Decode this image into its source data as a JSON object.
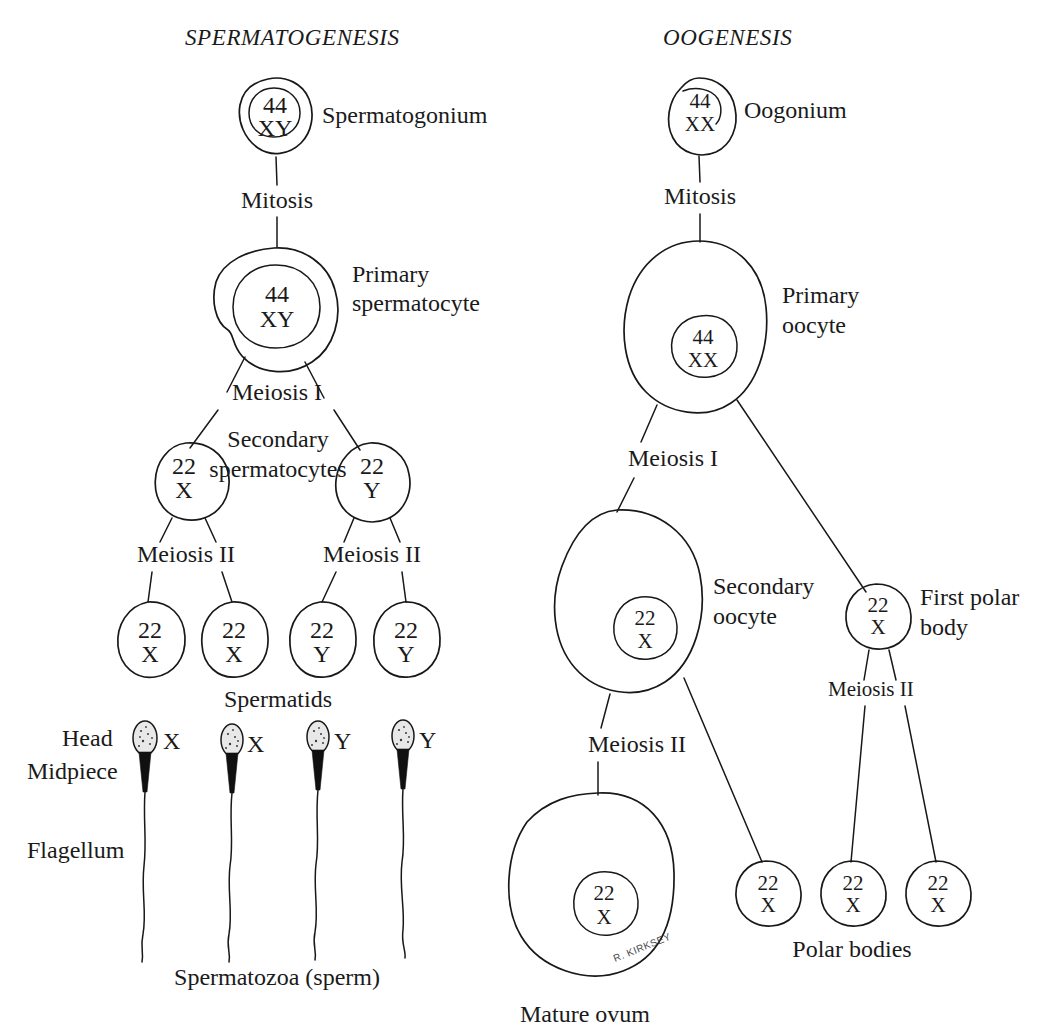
{
  "figure": {
    "type": "diagram",
    "background_color": "#ffffff",
    "ink_color": "#181818",
    "signature": "R. KIRKSEY"
  },
  "columns": {
    "left": {
      "title": "SPERMATOGENESIS"
    },
    "right": {
      "title": "OOGENESIS"
    }
  },
  "spermatogenesis": {
    "title": "SPERMATOGENESIS",
    "spermatogonium": {
      "label": "Spermatogonium",
      "chromosome_count": "44",
      "sex_chromosomes": "XY"
    },
    "mitosis_label": "Mitosis",
    "primary_spermatocyte": {
      "label_line1": "Primary",
      "label_line2": "spermatocyte",
      "chromosome_count": "44",
      "sex_chromosomes": "XY"
    },
    "meiosis_one_label": "Meiosis  I",
    "secondary_spermatocytes": {
      "label_line1": "Secondary",
      "label_line2": "spermatocytes",
      "cells": [
        {
          "chromosome_count": "22",
          "sex_chromosomes": "X"
        },
        {
          "chromosome_count": "22",
          "sex_chromosomes": "Y"
        }
      ]
    },
    "meiosis_two_label_left": "Meiosis II",
    "meiosis_two_label_right": "Meiosis II",
    "spermatids": {
      "label": "Spermatids",
      "cells": [
        {
          "chromosome_count": "22",
          "sex_chromosomes": "X"
        },
        {
          "chromosome_count": "22",
          "sex_chromosomes": "X"
        },
        {
          "chromosome_count": "22",
          "sex_chromosomes": "Y"
        },
        {
          "chromosome_count": "22",
          "sex_chromosomes": "Y"
        }
      ]
    },
    "sperm_part_labels": {
      "head": "Head",
      "midpiece": "Midpiece",
      "flagellum": "Flagellum"
    },
    "spermatozoa": {
      "label": "Spermatozoa (sperm)",
      "cells": [
        {
          "sex_chromosome": "X"
        },
        {
          "sex_chromosome": "X"
        },
        {
          "sex_chromosome": "Y"
        },
        {
          "sex_chromosome": "Y"
        }
      ]
    }
  },
  "oogenesis": {
    "title": "OOGENESIS",
    "oogonium": {
      "label": "Oogonium",
      "chromosome_count": "44",
      "sex_chromosomes": "XX"
    },
    "mitosis_label": "Mitosis",
    "primary_oocyte": {
      "label_line1": "Primary",
      "label_line2": "oocyte",
      "chromosome_count": "44",
      "sex_chromosomes": "XX"
    },
    "meiosis_one_label": "Meiosis I",
    "secondary_oocyte": {
      "label_line1": "Secondary",
      "label_line2": "oocyte",
      "chromosome_count": "22",
      "sex_chromosomes": "X"
    },
    "first_polar_body": {
      "label_line1": "First polar",
      "label_line2": "body",
      "chromosome_count": "22",
      "sex_chromosomes": "X"
    },
    "meiosis_two_label_left": "Meiosis II",
    "meiosis_two_label_right": "Meiosis II",
    "mature_ovum": {
      "label": "Mature ovum",
      "chromosome_count": "22",
      "sex_chromosomes": "X"
    },
    "polar_bodies": {
      "label": "Polar bodies",
      "cells": [
        {
          "chromosome_count": "22",
          "sex_chromosomes": "X"
        },
        {
          "chromosome_count": "22",
          "sex_chromosomes": "X"
        },
        {
          "chromosome_count": "22",
          "sex_chromosomes": "X"
        }
      ]
    }
  }
}
